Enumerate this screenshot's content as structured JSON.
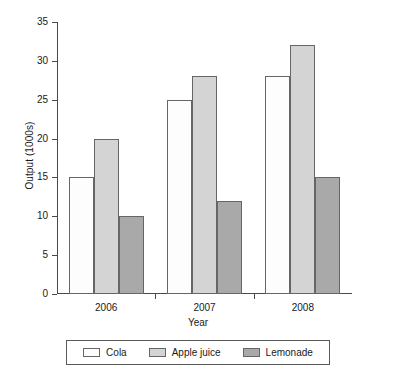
{
  "chart_data": {
    "type": "bar",
    "title": "",
    "xlabel": "Year",
    "ylabel": "Output (1000s)",
    "categories": [
      "2006",
      "2007",
      "2008"
    ],
    "series": [
      {
        "name": "Cola",
        "values": [
          15,
          25,
          28
        ],
        "color": "#fdfdfd"
      },
      {
        "name": "Apple juice",
        "values": [
          20,
          28,
          32
        ],
        "color": "#d4d4d4"
      },
      {
        "name": "Lemonade",
        "values": [
          10,
          12,
          15
        ],
        "color": "#a9a9a9"
      }
    ],
    "ylim": [
      0,
      35
    ],
    "ytick_labels": [
      "0",
      "5",
      "10",
      "15",
      "20",
      "25",
      "30",
      "35"
    ],
    "ytick_values": [
      0,
      5,
      10,
      15,
      20,
      25,
      30,
      35
    ],
    "grid": false,
    "legend_position": "bottom",
    "bar_border_color": "#666666",
    "axis_color": "#4a4a4a"
  }
}
